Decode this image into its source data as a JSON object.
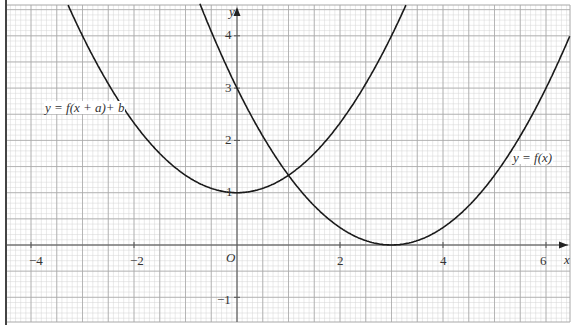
{
  "chart_data": {
    "type": "line",
    "title": "",
    "xlabel": "x",
    "ylabel": "y",
    "origin_label": "O",
    "xlim": [
      -4.5,
      6.5
    ],
    "ylim": [
      -1.5,
      4.7
    ],
    "x_ticks": [
      -4,
      -2,
      2,
      4,
      6
    ],
    "x_tick_labels": [
      "−4",
      "−2",
      "2",
      "4",
      "6"
    ],
    "y_ticks": [
      -1,
      1,
      2,
      3,
      4
    ],
    "y_tick_labels": [
      "−1",
      "1",
      "2",
      "3",
      "4"
    ],
    "grid": {
      "major_step": 0.5,
      "minor_step": 0.1
    },
    "series": [
      {
        "name": "y = f(x)",
        "equation_estimate": "(x - 3)^2 / 3",
        "vertex": [
          3,
          0
        ],
        "points": [
          [
            -0.7,
            4.56
          ],
          [
            0,
            3
          ],
          [
            1,
            1.33
          ],
          [
            2,
            0.33
          ],
          [
            3,
            0
          ],
          [
            4,
            0.33
          ],
          [
            5,
            1.33
          ],
          [
            6,
            3
          ],
          [
            6.5,
            4.08
          ]
        ]
      },
      {
        "name": "y = f(x + a) + b",
        "equation_estimate": "x^2 / 3 + 1",
        "vertex": [
          0,
          1
        ],
        "points": [
          [
            -3.3,
            4.63
          ],
          [
            -3,
            4
          ],
          [
            -2,
            2.33
          ],
          [
            -1,
            1.33
          ],
          [
            0,
            1
          ],
          [
            1,
            1.33
          ],
          [
            2,
            2.33
          ],
          [
            3,
            4
          ],
          [
            3.3,
            4.63
          ]
        ]
      }
    ],
    "intersection": [
      1,
      1.4
    ],
    "annotations": [
      "y = f(x + a)+ b",
      "y = f(x)"
    ]
  },
  "labels": {
    "curve_f": "y = f(x)",
    "curve_g": "y = f(x + a)+ b",
    "x_axis": "x",
    "y_axis": "y",
    "origin": "O",
    "x_tick_m4": "−4",
    "x_tick_m2": "−2",
    "x_tick_2": "2",
    "x_tick_4": "4",
    "x_tick_6": "6",
    "y_tick_m1": "−1",
    "y_tick_1": "1",
    "y_tick_2": "2",
    "y_tick_3": "3",
    "y_tick_4": "4"
  },
  "colors": {
    "minor_grid": "#d4d4d4",
    "major_grid": "#a8a8a8",
    "axis": "#555555",
    "curve": "#1a1a1a",
    "border": "#444444"
  }
}
